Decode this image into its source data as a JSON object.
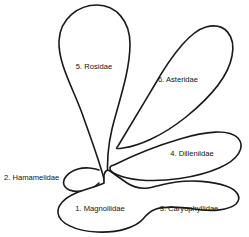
{
  "diagram": {
    "background_color": "#ffffff",
    "outline_color": "#1a1a1a",
    "text_color": "#141414",
    "lobes": [
      {
        "id": "magnoliidae",
        "number": "1.",
        "name": "Magnoliidae",
        "label": "1. Magnoliidae",
        "label_x": 100,
        "label_y": 209,
        "anchor": "middle",
        "role": "central-basal-group"
      },
      {
        "id": "hamamelidae",
        "number": "2.",
        "name": "Hamamelidae",
        "label": "2. Hamamelidae",
        "label_x": 4,
        "label_y": 178,
        "anchor": "start",
        "role": "left-hook-lobe"
      },
      {
        "id": "caryophyllidae",
        "number": "3.",
        "name": "Caryophyllidae",
        "label": "3. Caryophyllidae",
        "label_x": 189,
        "label_y": 209,
        "anchor": "middle",
        "role": "right-lower-lobe"
      },
      {
        "id": "dilleniidae",
        "number": "4.",
        "name": "Dilleniidae",
        "label": "4. Dilleniidae",
        "label_x": 192,
        "label_y": 154,
        "anchor": "middle",
        "role": "right-elongated-lobe"
      },
      {
        "id": "rosidae",
        "number": "5.",
        "name": "Rosidae",
        "label": "5. Rosidae",
        "label_x": 94,
        "label_y": 67,
        "anchor": "middle",
        "role": "upper-left-teardrop"
      },
      {
        "id": "asteridae",
        "number": "6.",
        "name": "Asteridae",
        "label": "6. Asteridae",
        "label_x": 178,
        "label_y": 80,
        "anchor": "middle",
        "role": "upper-right-teardrop"
      }
    ]
  }
}
